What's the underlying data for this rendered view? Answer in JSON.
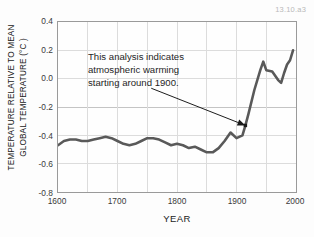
{
  "figure": {
    "id_label": "13.10.a3"
  },
  "axes": {
    "ylabel_line1": "TEMPERATURE RELATIVE TO MEAN",
    "ylabel_line2": "GLOBAL TEMPERATURE (°C )",
    "xlabel": "YEAR",
    "yticks": [
      "0.4",
      "0.2",
      "0.0",
      "-0.2",
      "-0.4",
      "-0.6",
      "-0.8"
    ],
    "xticks": [
      "1600",
      "1700",
      "1800",
      "1900",
      "2000"
    ]
  },
  "annotation": {
    "line1": "This analysis indicates",
    "line2": "atmospheric warming",
    "line3": "starting around 1900."
  },
  "colors": {
    "line": "#595959",
    "grid": "#dcdcdc",
    "zero_grid": "#c3c3c3",
    "frame": "#9a9a9a",
    "text": "#1b1b1b",
    "tick_text": "#3a3a3a",
    "figure_id": "#b9b9b9",
    "background": "#fdfdfd",
    "leader": "#1a1a1a"
  },
  "chart_data": {
    "type": "line",
    "title": "",
    "xlabel": "YEAR",
    "ylabel": "TEMPERATURE RELATIVE TO MEAN GLOBAL TEMPERATURE (°C)",
    "xlim": [
      1600,
      2000
    ],
    "ylim": [
      -0.8,
      0.4
    ],
    "xtick_values": [
      1600,
      1700,
      1800,
      1900,
      2000
    ],
    "ytick_values": [
      0.4,
      0.2,
      0.0,
      -0.2,
      -0.4,
      -0.6,
      -0.8
    ],
    "grid": true,
    "legend": "none",
    "series": [
      {
        "name": "Temperature anomaly",
        "x": [
          1600,
          1610,
          1620,
          1630,
          1640,
          1650,
          1660,
          1670,
          1680,
          1690,
          1700,
          1710,
          1720,
          1730,
          1740,
          1750,
          1760,
          1770,
          1780,
          1790,
          1800,
          1810,
          1820,
          1830,
          1840,
          1850,
          1860,
          1870,
          1880,
          1890,
          1900,
          1910,
          1915,
          1920,
          1930,
          1940,
          1945,
          1950,
          1960,
          1970,
          1975,
          1980,
          1985,
          1990,
          1995
        ],
        "y": [
          -0.47,
          -0.44,
          -0.43,
          -0.43,
          -0.44,
          -0.44,
          -0.43,
          -0.42,
          -0.41,
          -0.42,
          -0.44,
          -0.46,
          -0.47,
          -0.46,
          -0.44,
          -0.42,
          -0.42,
          -0.43,
          -0.45,
          -0.47,
          -0.46,
          -0.47,
          -0.49,
          -0.48,
          -0.5,
          -0.52,
          -0.52,
          -0.49,
          -0.44,
          -0.38,
          -0.42,
          -0.4,
          -0.33,
          -0.25,
          -0.08,
          0.06,
          0.12,
          0.06,
          0.05,
          -0.01,
          -0.03,
          0.04,
          0.1,
          0.13,
          0.2
        ]
      }
    ],
    "annotations": [
      {
        "text": "This analysis indicates atmospheric warming starting around 1900.",
        "point_x": 1915,
        "point_y": -0.33
      }
    ]
  }
}
